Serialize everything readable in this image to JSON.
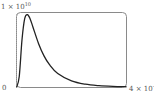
{
  "chart_data": {
    "type": "line",
    "title": "",
    "xlabel": "",
    "ylabel": "",
    "x_tick_labels": [
      "0",
      "4 × 10^-6"
    ],
    "y_tick_labels": [
      "1 × 10^10"
    ],
    "xlim": [
      0,
      4e-06
    ],
    "ylim": [
      0,
      10000000000.0
    ],
    "grid": false,
    "legend": null,
    "series": [
      {
        "name": "spectral radiance curve",
        "x": [
          0,
          1e-07,
          2e-07,
          3e-07,
          4e-07,
          5e-07,
          6e-07,
          8e-07,
          1e-06,
          1.2e-06,
          1.5e-06,
          2e-06,
          2.5e-06,
          3e-06,
          3.5e-06,
          4e-06
        ],
        "y": [
          0,
          1500000000.0,
          6500000000.0,
          9400000000.0,
          9900000000.0,
          9300000000.0,
          8200000000.0,
          6000000000.0,
          4300000000.0,
          3100000000.0,
          1900000000.0,
          900000000.0,
          450000000.0,
          250000000.0,
          150000000.0,
          100000000.0
        ]
      }
    ]
  },
  "labels": {
    "ymax_base": "1 × 10",
    "ymax_exp": "10",
    "xmin": "0",
    "xmax_base": "4 × 10",
    "xmax_exp": "-6"
  }
}
